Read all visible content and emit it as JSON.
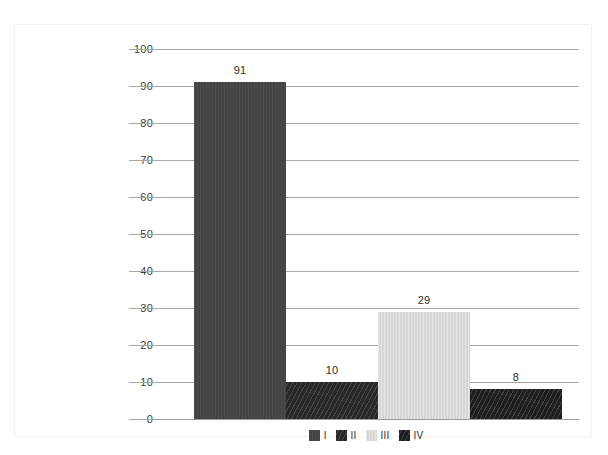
{
  "chart_data": {
    "type": "bar",
    "title": "",
    "subtitle": "",
    "xlabel": "",
    "ylabel": "",
    "categories": [
      "I",
      "II",
      "III",
      "IV"
    ],
    "values": [
      91,
      10,
      29,
      8
    ],
    "data_labels": [
      "91",
      "10",
      "29",
      "8"
    ],
    "ylim": [
      0,
      100
    ],
    "ytick_labels": [
      "100",
      "90",
      "80",
      "70",
      "60",
      "50",
      "40",
      "30",
      "20",
      "10",
      "0"
    ],
    "ytick_values": [
      100,
      90,
      80,
      70,
      60,
      50,
      40,
      30,
      20,
      10,
      0
    ],
    "grid": true,
    "grid_axis": "y",
    "xtick_labels": [],
    "legend": {
      "position": "bottom-center-inside",
      "entries": [
        {
          "label": "I",
          "color": "#454545",
          "pattern": "solid-dark-gray"
        },
        {
          "label": "II",
          "color": "#343434",
          "pattern": "diagonal-hatch"
        },
        {
          "label": "III",
          "color": "#d9d9d9",
          "pattern": "solid-light-gray"
        },
        {
          "label": "IV",
          "color": "#2a2a2a",
          "pattern": "diagonal-hatch-dark"
        }
      ]
    },
    "series": [
      {
        "name": "Series 1",
        "points": [
          {
            "category": "I",
            "value": 91,
            "label": "91",
            "color": "#454545"
          },
          {
            "category": "II",
            "value": 10,
            "label": "10",
            "color": "#343434"
          },
          {
            "category": "III",
            "value": 29,
            "label": "29",
            "color": "#d9d9d9"
          },
          {
            "category": "IV",
            "value": 8,
            "label": "8",
            "color": "#2a2a2a"
          }
        ]
      }
    ],
    "colors": {
      "gridline": "#a8a8a8",
      "axis_text": "#3b3b3b",
      "label_text": "#2e2e2e",
      "frame_border": "#f2f2f2",
      "background": "#ffffff"
    }
  }
}
